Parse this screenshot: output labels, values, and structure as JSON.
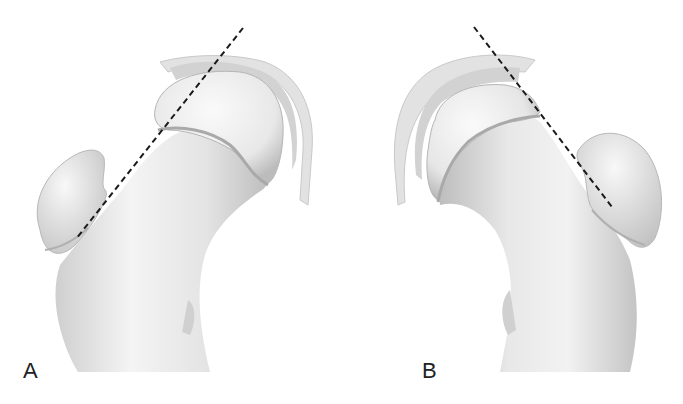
{
  "figure": {
    "panels": [
      {
        "id": "A",
        "label": "A",
        "subject": "proximal femur, left orientation",
        "reference_line": {
          "style": "dashed",
          "from": [
            243,
            28
          ],
          "to": [
            76,
            239
          ]
        }
      },
      {
        "id": "B",
        "label": "B",
        "subject": "proximal femur, mirrored orientation",
        "reference_line": {
          "style": "dashed",
          "from": [
            474,
            27
          ],
          "to": [
            612,
            207
          ]
        }
      }
    ],
    "colors": {
      "background": "#ffffff",
      "bone_light": "#f2f2f2",
      "bone_mid": "#d9d9d9",
      "bone_shadow": "#a8a8a8",
      "cartilage": "#c8c8c8",
      "capsule": "#e6e6e6",
      "dashed_line": "#1a1a1a",
      "label_text": "#222222"
    }
  }
}
